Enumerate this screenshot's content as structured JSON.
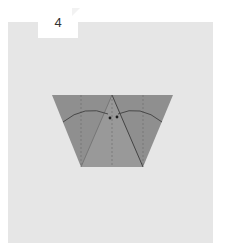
{
  "step": {
    "number": "4"
  },
  "colors": {
    "background": "#ffffff",
    "panel": "#e6e6e6",
    "paper": "#8f8f8f",
    "paper_dark": "#7d7d7d",
    "crease": "#4a4a4a"
  }
}
